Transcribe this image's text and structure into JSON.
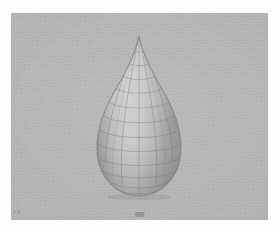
{
  "render": {
    "title": "3D wireframe teardrop surface render",
    "background_color": "#b1b1b1",
    "surface_color": "#a8a8a8",
    "wireframe_color": "#6a6a6a",
    "highlight_color": "#cfcfcf",
    "shadow_color": "#7c7c7c",
    "canvas": {
      "x": 11,
      "y": 13,
      "width": 257,
      "height": 207
    }
  },
  "model": {
    "name": "teardrop",
    "shape_description": "axisymmetric teardrop / water-drop surface of revolution",
    "apex": {
      "x": 137,
      "y": 35
    },
    "base": {
      "x": 138,
      "y": 198
    },
    "widest": {
      "left_x": 84,
      "right_x": 192,
      "y": 143
    },
    "mesh": {
      "type": "quad-wireframe",
      "meridian_lines": 9,
      "parallel_lines": 13,
      "visible_meridians": 5,
      "visible_parallels": 13
    },
    "lighting": {
      "key_direction": "upper-left",
      "rim_shadow": "left and lower-right edge"
    }
  },
  "annotations": {
    "bottom_left_label": "3.4",
    "bottom_center_label": "·"
  }
}
